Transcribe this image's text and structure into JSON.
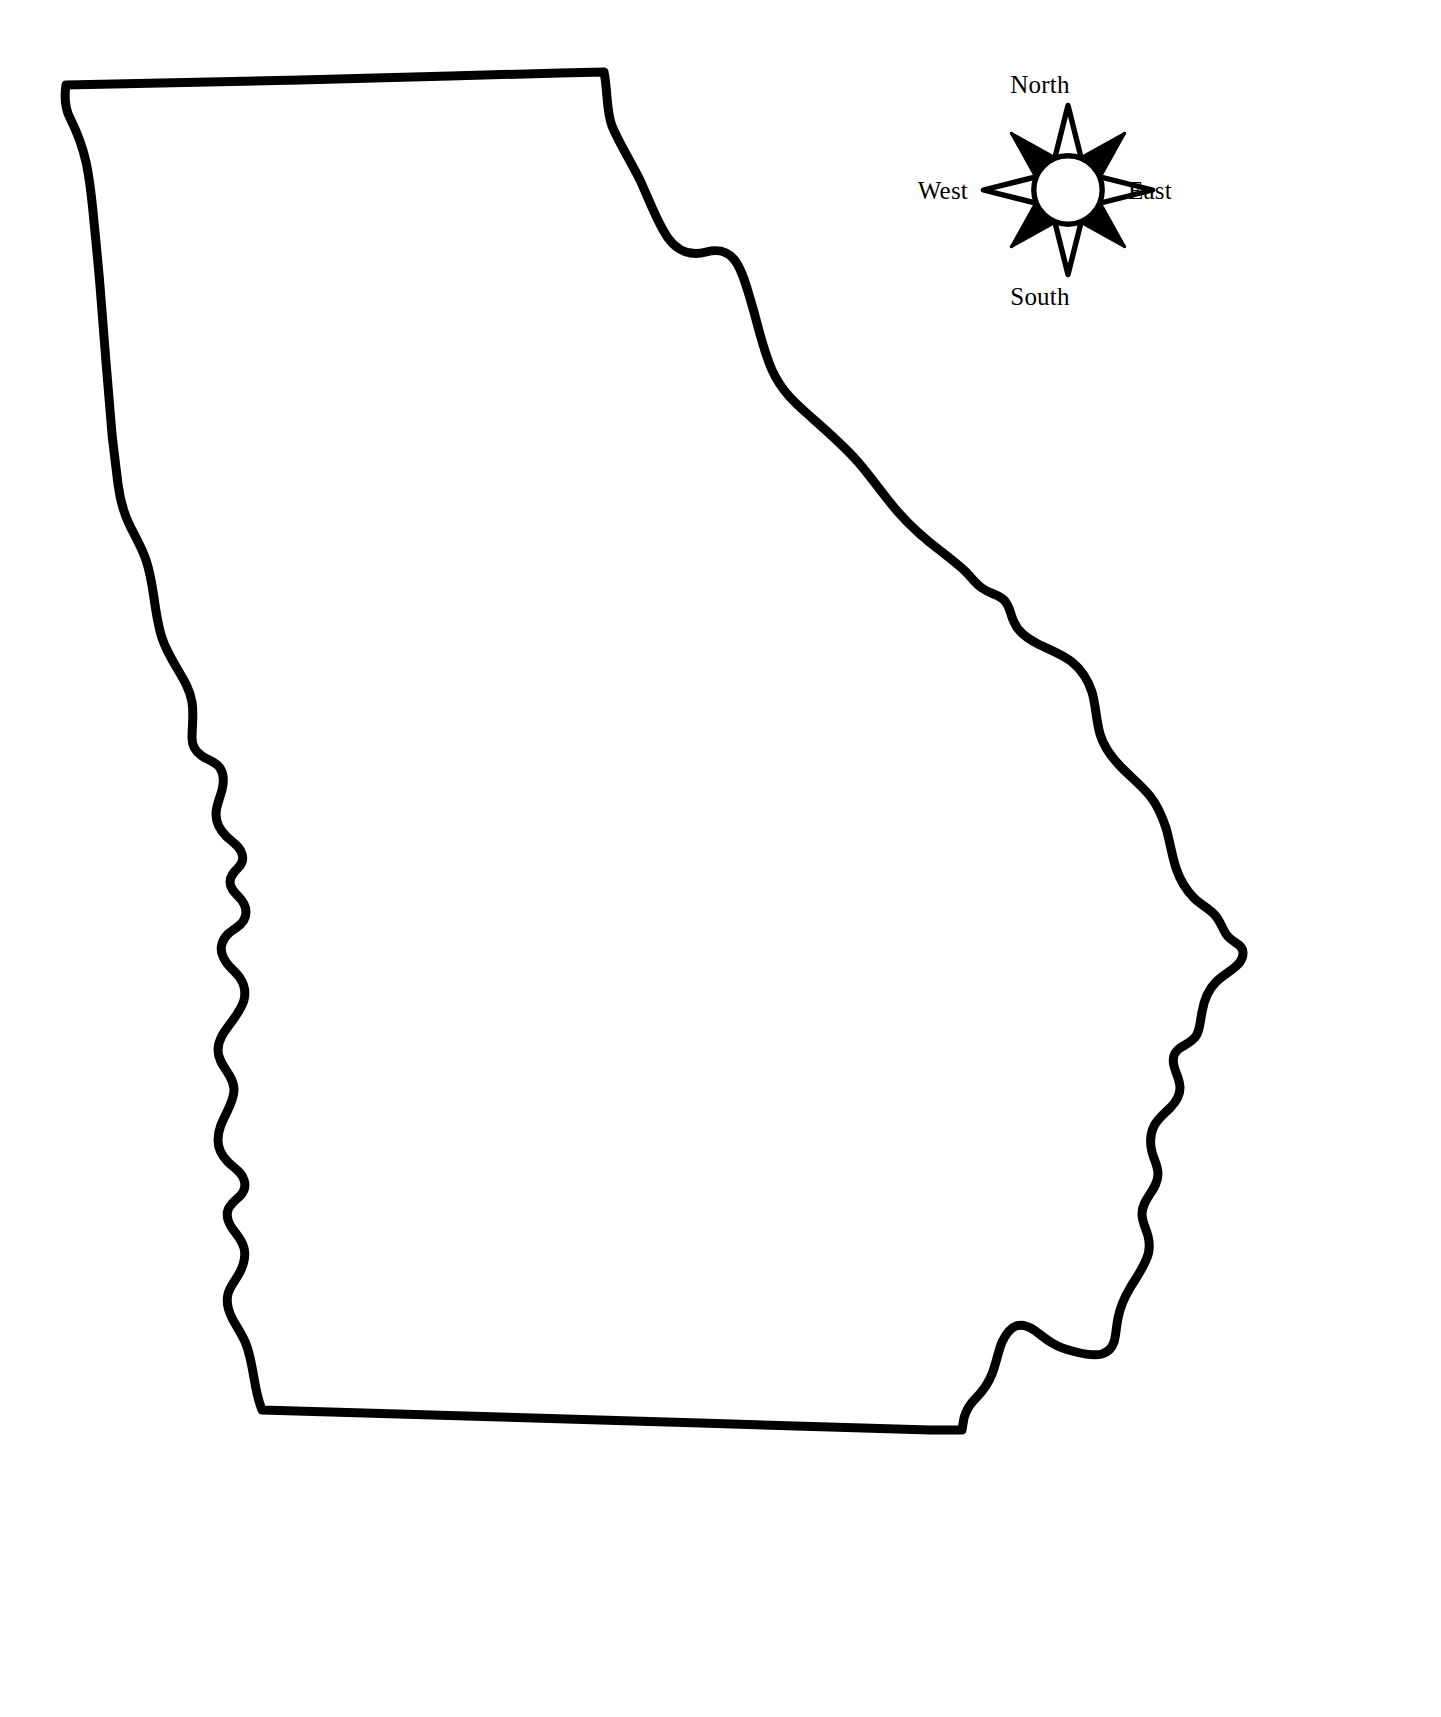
{
  "document": {
    "kind": "outline-map",
    "subject": "State of Georgia",
    "background_color": "#ffffff",
    "ink_color": "#000000"
  },
  "map": {
    "name": "georgia-state-outline",
    "stroke_color": "#000000",
    "fill_color": "#ffffff",
    "stroke_width": 9,
    "labels": []
  },
  "compass": {
    "name": "compass-rose",
    "style": "eight-point-star",
    "cardinal_fill": "#ffffff",
    "ordinal_fill": "#000000",
    "hub_fill": "#ffffff",
    "stroke_color": "#000000",
    "labels": {
      "north": "North",
      "south": "South",
      "east": "East",
      "west": "West"
    }
  }
}
